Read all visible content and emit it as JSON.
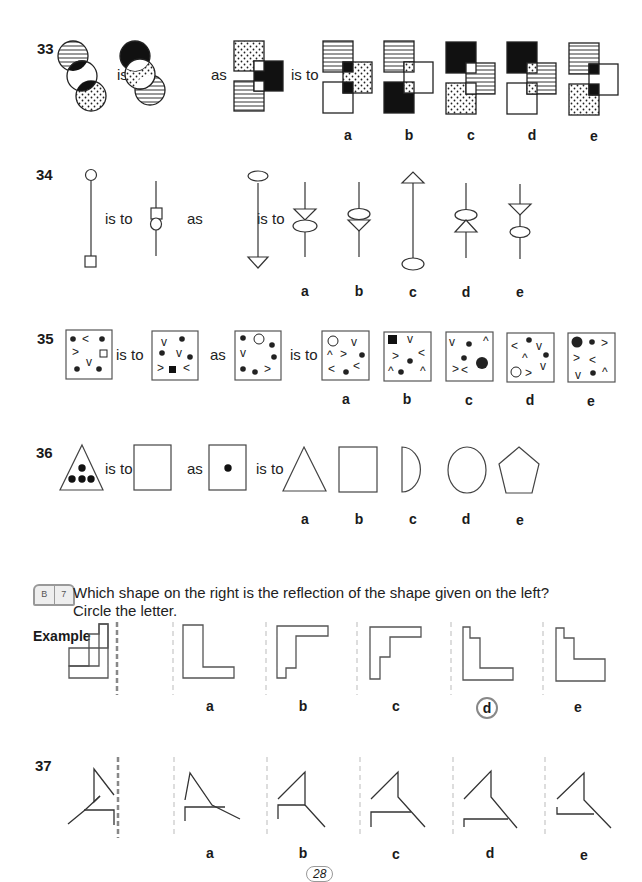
{
  "questions": {
    "q33": {
      "number": "33",
      "words": [
        "is to",
        "as",
        "is to"
      ]
    },
    "q34": {
      "number": "34",
      "words": [
        "is to",
        "as",
        "is to"
      ]
    },
    "q35": {
      "number": "35",
      "words": [
        "is to",
        "as",
        "is to"
      ]
    },
    "q36": {
      "number": "36",
      "words": [
        "is to",
        "as",
        "is to"
      ]
    },
    "q37": {
      "number": "37"
    }
  },
  "options": [
    "a",
    "b",
    "c",
    "d",
    "e"
  ],
  "section": {
    "icon": "book-icon",
    "icon_labels": [
      "B",
      "7"
    ],
    "instruction_line1": "Which shape on the right is the reflection of the shape given on the left?",
    "instruction_line2": "Circle the letter.",
    "example_label": "Example",
    "example_answer": "d"
  },
  "footer": {
    "page_number": "28"
  },
  "colors": {
    "ink": "#1a1a1a",
    "dashed_line": "#999999",
    "circle_mark": "#888888"
  }
}
